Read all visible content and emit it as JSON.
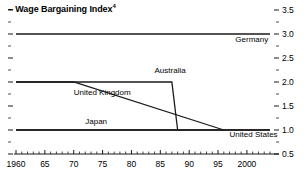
{
  "chart_data": {
    "type": "line",
    "title": "Wage Bargaining Index",
    "title_superscript": "4",
    "title_dash": "–",
    "xlabel": "",
    "ylabel": "",
    "xlim": [
      1960,
      2004
    ],
    "ylim": [
      0.5,
      3.5
    ],
    "grid": false,
    "legend_position": "inline-labels",
    "y_ticks": [
      {
        "value": 3.5,
        "label": "3.5"
      },
      {
        "value": 3.0,
        "label": "3.0"
      },
      {
        "value": 2.5,
        "label": "2.5"
      },
      {
        "value": 2.0,
        "label": "2.0"
      },
      {
        "value": 1.5,
        "label": "1.5"
      },
      {
        "value": 1.0,
        "label": "1.0"
      },
      {
        "value": 0.5,
        "label": "0.5"
      }
    ],
    "y_minor_ticks": [
      3.25,
      2.75,
      2.25,
      1.75,
      1.25,
      0.75
    ],
    "x_ticks": [
      {
        "value": 1960,
        "label": "1960"
      },
      {
        "value": 1965,
        "label": "65"
      },
      {
        "value": 1970,
        "label": "70"
      },
      {
        "value": 1975,
        "label": "75"
      },
      {
        "value": 1980,
        "label": "80"
      },
      {
        "value": 1985,
        "label": "85"
      },
      {
        "value": 1990,
        "label": "90"
      },
      {
        "value": 1995,
        "label": "95"
      },
      {
        "value": 2000,
        "label": "2000"
      }
    ],
    "x_minor_tick_step": 1,
    "series": [
      {
        "name": "Germany",
        "label": "Germany",
        "label_x": 1998,
        "label_y": 2.83,
        "points": [
          {
            "x": 1960,
            "y": 3.0
          },
          {
            "x": 2004,
            "y": 3.0
          }
        ]
      },
      {
        "name": "Australia",
        "label": "Australia",
        "label_x": 1984,
        "label_y": 2.18,
        "points": [
          {
            "x": 1960,
            "y": 2.0
          },
          {
            "x": 1987,
            "y": 2.0
          },
          {
            "x": 1988,
            "y": 1.0
          }
        ]
      },
      {
        "name": "United Kingdom",
        "label": "United Kingdom",
        "label_x": 1970,
        "label_y": 1.72,
        "points": [
          {
            "x": 1960,
            "y": 2.0
          },
          {
            "x": 1970,
            "y": 2.0
          },
          {
            "x": 1996,
            "y": 1.0
          }
        ]
      },
      {
        "name": "Japan",
        "label": "Japan",
        "label_x": 1972,
        "label_y": 1.12,
        "points": [
          {
            "x": 1960,
            "y": 1.0
          },
          {
            "x": 2004,
            "y": 1.0
          }
        ]
      },
      {
        "name": "United States",
        "label": "United States",
        "label_x": 1997,
        "label_y": 0.85,
        "points": [
          {
            "x": 1960,
            "y": 1.0
          },
          {
            "x": 2004,
            "y": 1.0
          }
        ]
      }
    ]
  }
}
